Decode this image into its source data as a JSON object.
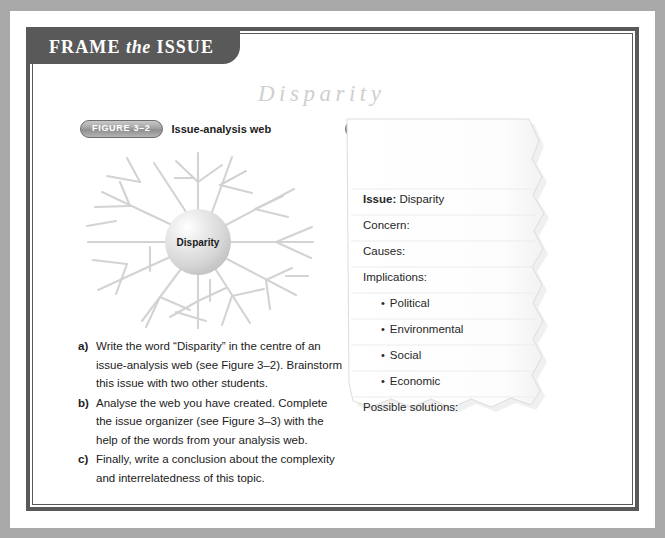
{
  "banner": {
    "word1": "FRAME",
    "word2": "the",
    "word3": "ISSUE"
  },
  "script_title": "Disparity",
  "figures": {
    "web": {
      "pill": "FIGURE 3–2",
      "caption": "Issue-analysis web",
      "center_label": "Disparity"
    },
    "organizer": {
      "pill": "FIGURE 3–3",
      "caption": "Issue organizer",
      "rows": [
        {
          "label": "Issue:",
          "value": " Disparity",
          "bold_label": true,
          "bullet": false
        },
        {
          "label": "Concern:",
          "value": "",
          "bold_label": false,
          "bullet": false
        },
        {
          "label": "Causes:",
          "value": "",
          "bold_label": false,
          "bullet": false
        },
        {
          "label": "Implications:",
          "value": "",
          "bold_label": false,
          "bullet": false
        },
        {
          "label": "Political",
          "value": "",
          "bold_label": false,
          "bullet": true
        },
        {
          "label": "Environmental",
          "value": "",
          "bold_label": false,
          "bullet": true
        },
        {
          "label": "Social",
          "value": "",
          "bold_label": false,
          "bullet": true
        },
        {
          "label": "Economic",
          "value": "",
          "bold_label": false,
          "bullet": true
        },
        {
          "label": "Possible solutions:",
          "value": "",
          "bold_label": false,
          "bullet": false
        }
      ]
    }
  },
  "instructions": [
    {
      "marker": "a)",
      "text": "Write the word “Disparity” in the centre of an issue-analysis web (see Figure 3–2). Brainstorm this issue with two other students."
    },
    {
      "marker": "b)",
      "text": "Analyse the web you have created. Complete the issue organizer (see Figure 3–3) with the help of the words from your analysis web."
    },
    {
      "marker": "c)",
      "text": "Finally, write a conclusion about the complexity and interrelatedness of this topic."
    }
  ],
  "colors": {
    "banner_bg": "#595959",
    "frame_rule": "#595959",
    "margin_band": "#a8a8a8",
    "script_title": "#cfcfcf",
    "web_line": "#d3d3d3",
    "paper": "#ffffff",
    "rule_line": "#e9e9e9",
    "text": "#1b1b1b"
  }
}
